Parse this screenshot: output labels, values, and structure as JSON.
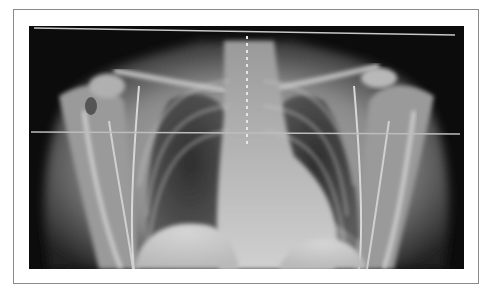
{
  "figure": {
    "caption": "",
    "overlay_lines": [
      {
        "name": "upper-reference-line",
        "x1": 5,
        "y1": 2,
        "x2": 426,
        "y2": 9,
        "color": "#c8c8c8"
      },
      {
        "name": "mid-reference-line",
        "x1": 2,
        "y1": 106,
        "x2": 431,
        "y2": 108,
        "color": "#bdbdbd"
      }
    ],
    "colors": {
      "frame_border": "#8a8a8a",
      "background": "#0c0c0c",
      "soft_tissue": "#8a8a8a",
      "bone": "#d8d8d8",
      "lung": "#3a3a3a"
    }
  }
}
